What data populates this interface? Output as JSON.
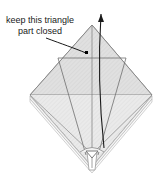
{
  "figure": {
    "name": "origami-fold-step-diagram",
    "background_color": "#ffffff",
    "width": 167,
    "height": 175
  },
  "annotation": {
    "line1": "keep this triangle",
    "line2": "part closed",
    "text_color": "#1a1a1a",
    "leader_line_color": "#000000",
    "pointer_dot_color": "#000000"
  },
  "arrow": {
    "name": "unfold-direction-arrow",
    "color": "#000000",
    "description": "curved arrow rising from the top apex off the top edge"
  },
  "model": {
    "name": "folded-paper-diamond",
    "fill_color": "#e8e8e8",
    "upper_triangle_fill": "#dcdcdc",
    "lower_fill": "#ededed",
    "outline_color": "#808080",
    "fold_line_color": "#6e6e6e",
    "layer_edge_color": "#9a9a9a",
    "vertices": {
      "top": [
        92,
        25
      ],
      "left": [
        30,
        95
      ],
      "right": [
        152,
        95
      ],
      "bottom": [
        92,
        166
      ]
    },
    "horizontal_fold_y": 58,
    "bottom_flap": {
      "name": "bottom-center-flap",
      "description": "narrow vertical slit with small chevron marker near bottom point"
    }
  }
}
